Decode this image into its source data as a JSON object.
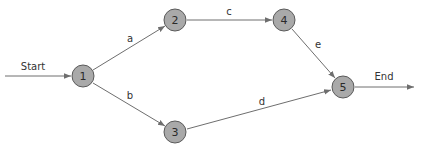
{
  "diagram": {
    "type": "activity-on-arrow network",
    "start_label": "Start",
    "end_label": "End",
    "nodes": [
      {
        "id": "1",
        "label": "1",
        "x": 83,
        "y": 76
      },
      {
        "id": "2",
        "label": "2",
        "x": 175,
        "y": 20
      },
      {
        "id": "3",
        "label": "3",
        "x": 175,
        "y": 132
      },
      {
        "id": "4",
        "label": "4",
        "x": 284,
        "y": 20
      },
      {
        "id": "5",
        "label": "5",
        "x": 343,
        "y": 87
      }
    ],
    "edges": [
      {
        "from": "1",
        "to": "2",
        "label": "a"
      },
      {
        "from": "1",
        "to": "3",
        "label": "b"
      },
      {
        "from": "2",
        "to": "4",
        "label": "c"
      },
      {
        "from": "3",
        "to": "5",
        "label": "d"
      },
      {
        "from": "4",
        "to": "5",
        "label": "e"
      }
    ],
    "colors": {
      "node_fill": "#a9a9a9",
      "node_stroke": "#5a5a5a",
      "edge": "#6e6e6e"
    }
  }
}
